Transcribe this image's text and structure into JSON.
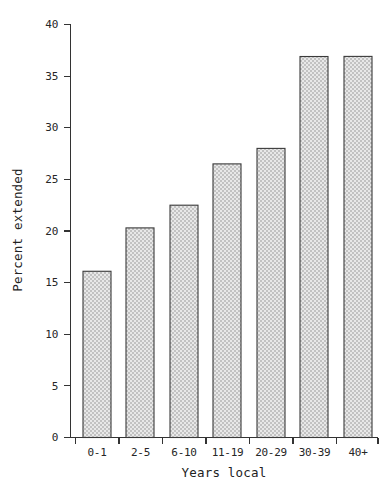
{
  "chart_data": {
    "type": "bar",
    "title": "",
    "subtitle": "",
    "xlabel": "Years local",
    "ylabel": "Percent extended",
    "categories": [
      "0-1",
      "2-5",
      "6-10",
      "11-19",
      "20-29",
      "30-39",
      "40+"
    ],
    "values": [
      14.0,
      16.1,
      20.3,
      22.5,
      26.5,
      28.0,
      36.9
    ],
    "ylim": [
      0,
      40
    ],
    "yticks": [
      0,
      5,
      10,
      15,
      20,
      25,
      30,
      35,
      40
    ],
    "ytick_labels": [
      "0",
      "5",
      "10",
      "15",
      "20",
      "25",
      "30",
      "35",
      "40"
    ],
    "grid": false,
    "legend": false,
    "legend_position": "none",
    "series": [
      {
        "name": "Percent extended",
        "values": [
          14.0,
          16.1,
          20.3,
          22.5,
          26.5,
          28.0,
          36.9
        ]
      }
    ],
    "bar_fill": "#dcdcdc",
    "bar_edge": "#3a3a3a",
    "bar_pattern": "dotted-checker",
    "background": "#ffffff",
    "axis_color": "#333333"
  }
}
